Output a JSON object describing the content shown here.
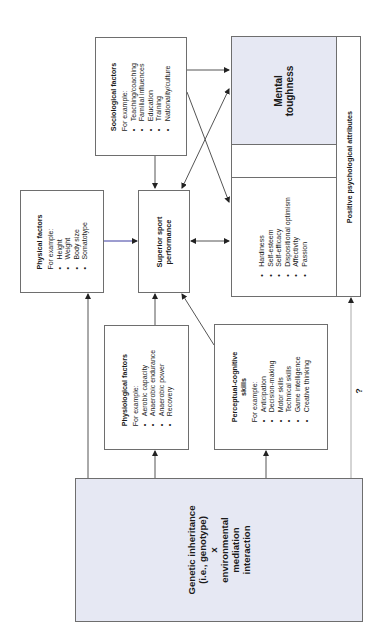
{
  "diagram": {
    "orientation": "rotated -90deg (read bottom-to-top)",
    "colors": {
      "box_border": "#6e6e6e",
      "shaded_fill": "#e6e8f3",
      "arrow": "#333333",
      "blue_arrow_line": "#3a3aa0"
    },
    "nodes": {
      "sociological": {
        "title": "Sociological factors",
        "intro": "For example:",
        "items": [
          "Teaching/coaching",
          "Familial influences",
          "Education",
          "Training",
          "Nationality/culture"
        ]
      },
      "mental_toughness": {
        "line1": "Mental",
        "line2": "toughness"
      },
      "positive_attributes": {
        "label": "Positive psychological attributes",
        "items": [
          "Hardiness",
          "Self-esteem",
          "Self-efficacy",
          "Dispositional optimism",
          "Affectivity",
          "Passion"
        ]
      },
      "physical": {
        "title": "Physical factors",
        "intro": "For example:",
        "items": [
          "Height",
          "Weight",
          "Body size",
          "Somatotype"
        ]
      },
      "performance": {
        "line1": "Superior sport",
        "line2": "performance"
      },
      "physiological": {
        "title": "Physiological factors",
        "intro": "For example:",
        "items": [
          "Aerobic capacity",
          "Anaerobic endurance",
          "Anaerobic power",
          "Recovery"
        ]
      },
      "perceptual": {
        "title_line1": "Perceptual-cognitive",
        "title_line2": "skills",
        "intro": "For example:",
        "items": [
          "Anticipation",
          "Decision-making",
          "Motor skills",
          "Technical skills",
          "Game intelligence",
          "Creative thinking"
        ]
      },
      "genetic": {
        "line1": "Genetic inheritance",
        "line2": "(i.e., genotype)",
        "line3": "x",
        "line4": "environmental",
        "line5": "mediation",
        "line6": "interaction"
      }
    },
    "uncertain_link_label": "?",
    "edges": [
      {
        "from": "genetic",
        "to": "physical"
      },
      {
        "from": "genetic",
        "to": "physiological"
      },
      {
        "from": "genetic",
        "to": "perceptual"
      },
      {
        "from": "genetic",
        "to": "positive_attributes",
        "label": "?"
      },
      {
        "from": "physical",
        "to": "performance"
      },
      {
        "from": "physiological",
        "to": "performance"
      },
      {
        "from": "perceptual",
        "to": "performance"
      },
      {
        "from": "sociological",
        "to": "performance"
      },
      {
        "from": "sociological",
        "to": "mental_toughness"
      },
      {
        "from": "sociological",
        "to": "positive_attributes"
      },
      {
        "from": "performance",
        "to": "mental_toughness",
        "bidirectional": true
      },
      {
        "from": "performance",
        "to": "positive_attributes",
        "bidirectional": true
      },
      {
        "from": "mental_toughness",
        "to": "positive_attributes"
      }
    ]
  }
}
